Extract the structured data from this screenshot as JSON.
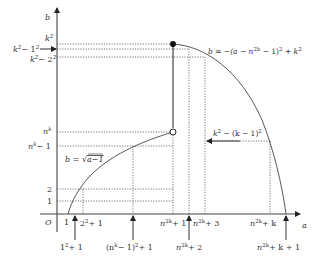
{
  "diagram": {
    "axes": {
      "x_label": "a",
      "y_label": "b",
      "origin_label": "O"
    },
    "y_ticks": [
      {
        "id": "k2",
        "label": "k",
        "sup": "2",
        "rest": ""
      },
      {
        "id": "k2m1",
        "label": "k",
        "sup": "2",
        "rest": "− 1",
        "sup2": "2"
      },
      {
        "id": "k2m2",
        "label": "k",
        "sup": "2",
        "rest": "− 2",
        "sup2": "2"
      },
      {
        "id": "nk",
        "label": "n",
        "sup": "k",
        "rest": ""
      },
      {
        "id": "nkm1",
        "label": "n",
        "sup": "k",
        "rest": "− 1"
      },
      {
        "id": "two",
        "label": "2"
      },
      {
        "id": "one",
        "label": "1"
      }
    ],
    "x_ticks_upper": [
      {
        "id": "one",
        "label": "1"
      },
      {
        "id": "two_sq_plus1",
        "base": "2",
        "sup": "2",
        "rest": "+ 1"
      },
      {
        "id": "n2k_plus1",
        "base": "n",
        "sup": "2k",
        "rest": "+ 1"
      },
      {
        "id": "n2k_plus3",
        "base": "n",
        "sup": "2k",
        "rest": "+ 3"
      },
      {
        "id": "n2k_plus_k",
        "base": "n",
        "sup": "2k",
        "rest": "+ k"
      }
    ],
    "x_ticks_lower": [
      {
        "id": "one_sq_plus1",
        "base": "1",
        "sup": "2",
        "rest": "+ 1"
      },
      {
        "id": "nk_m1_sq_plus1",
        "base": "(n",
        "sup": "k",
        "rest": "− 1)",
        "sup2": "2",
        "rest2": "+ 1"
      },
      {
        "id": "n2k_plus2",
        "base": "n",
        "sup": "2k",
        "rest": "+ 2"
      },
      {
        "id": "n2k_plus_k_plus1",
        "base": "n",
        "sup": "2k",
        "rest": "+ k + 1"
      }
    ],
    "curves": {
      "sqrt_label": "b = √(a−1)",
      "sqrt_label_lhs": "b = ",
      "sqrt_label_rad": "a−1",
      "parabola_label_lhs": "b = −(a − n",
      "parabola_label_sup": "2k",
      "parabola_label_mid": " − 1)",
      "parabola_label_sup2": "2",
      "parabola_label_rest": " + k",
      "parabola_label_sup3": "2"
    },
    "annotation": {
      "lhs": "k",
      "sup": "2",
      "mid": " − (k − 1)",
      "sup2": "2"
    },
    "points": {
      "filled": {
        "label": "filled-endpoint",
        "at": "(n^2k+1, k^2)"
      },
      "open": {
        "label": "open-endpoint",
        "at": "(n^2k+1, n^k)"
      }
    }
  }
}
